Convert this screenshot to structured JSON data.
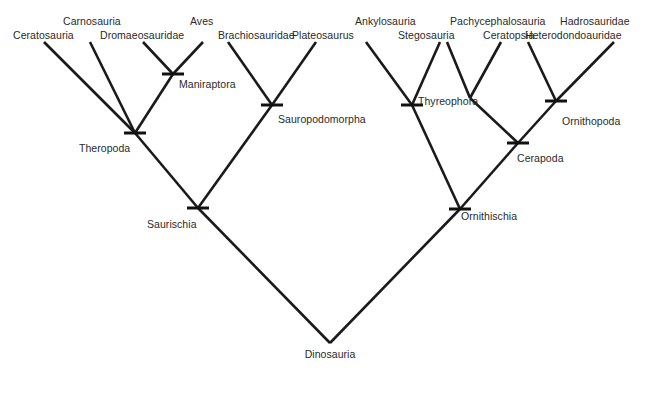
{
  "figure": {
    "type": "cladogram",
    "background_color": "#ffffff",
    "line_color": "#1a1a1a",
    "text_color": "#2a2a2a"
  },
  "tips": [
    {
      "id": "ceratosauria",
      "label": "Ceratosauria",
      "label_x": 13,
      "label_y": 30,
      "anchor": "start"
    },
    {
      "id": "carnosauria",
      "label": "Carnosauria",
      "label_x": 63,
      "label_y": 16,
      "anchor": "start"
    },
    {
      "id": "dromaeosauridae",
      "label": "Dromaeosauridae",
      "label_x": 100,
      "label_y": 30,
      "anchor": "start"
    },
    {
      "id": "aves",
      "label": "Aves",
      "label_x": 190,
      "label_y": 16,
      "anchor": "start"
    },
    {
      "id": "brachiosauridae",
      "label": "Brachiosauridae",
      "label_x": 218,
      "label_y": 30,
      "anchor": "start"
    },
    {
      "id": "plateosaurus",
      "label": "Plateosaurus",
      "label_x": 292,
      "label_y": 30,
      "anchor": "start"
    },
    {
      "id": "ankylosauria",
      "label": "Ankylosauria",
      "label_x": 355,
      "label_y": 16,
      "anchor": "start"
    },
    {
      "id": "stegosauria",
      "label": "Stegosauria",
      "label_x": 398,
      "label_y": 30,
      "anchor": "start"
    },
    {
      "id": "pachycephalosauria",
      "label": "Pachycephalosauria",
      "label_x": 450,
      "label_y": 16,
      "anchor": "start"
    },
    {
      "id": "ceratopsia",
      "label": "Ceratopsia",
      "label_x": 483,
      "label_y": 30,
      "anchor": "start"
    },
    {
      "id": "hadrosauridae",
      "label": "Hadrosauridae",
      "label_x": 560,
      "label_y": 16,
      "anchor": "start"
    },
    {
      "id": "heterodondoauridae",
      "label": "Heterodondoauridae",
      "label_x": 525,
      "label_y": 30,
      "anchor": "start"
    }
  ],
  "nodes": [
    {
      "id": "maniraptora",
      "label": "Maniraptora",
      "x": 173,
      "y": 74,
      "label_x": 179,
      "label_y": 79,
      "tick": true
    },
    {
      "id": "theropoda",
      "label": "Theropoda",
      "x": 135,
      "y": 133,
      "label_x": 79,
      "label_y": 143,
      "tick": true
    },
    {
      "id": "sauropodomorpha",
      "label": "Sauropodomorpha",
      "x": 272,
      "y": 105,
      "label_x": 278,
      "label_y": 114,
      "tick": true
    },
    {
      "id": "saurischia",
      "label": "Saurischia",
      "x": 198,
      "y": 208,
      "label_x": 147,
      "label_y": 219,
      "tick": true
    },
    {
      "id": "thyreophora",
      "label": "Thyreophora",
      "x": 412,
      "y": 105,
      "label_x": 418,
      "label_y": 96,
      "tick": true
    },
    {
      "id": "marginocephalia",
      "label": "",
      "x": 470,
      "y": 98,
      "label_x": 0,
      "label_y": 0,
      "tick": false
    },
    {
      "id": "ornithopoda",
      "label": "Ornithopoda",
      "x": 556,
      "y": 101,
      "label_x": 562,
      "label_y": 116,
      "tick": true
    },
    {
      "id": "cerapoda",
      "label": "Cerapoda",
      "x": 518,
      "y": 143,
      "label_x": 517,
      "label_y": 153,
      "tick": true
    },
    {
      "id": "ornithischia",
      "label": "Ornithischia",
      "x": 460,
      "y": 209,
      "label_x": 461,
      "label_y": 211,
      "tick": true
    },
    {
      "id": "dinosauria",
      "label": "Dinosauria",
      "x": 330,
      "y": 343,
      "label_x": 330,
      "label_y": 349,
      "tick": false
    }
  ],
  "branches": [
    {
      "from": "theropoda",
      "to": "ceratosauria",
      "x1": 135,
      "y1": 133,
      "x2": 44,
      "y2": 42
    },
    {
      "from": "theropoda",
      "to": "carnosauria",
      "x1": 135,
      "y1": 133,
      "x2": 90,
      "y2": 42
    },
    {
      "from": "theropoda",
      "to": "maniraptora",
      "x1": 135,
      "y1": 133,
      "x2": 173,
      "y2": 74
    },
    {
      "from": "maniraptora",
      "to": "dromaeosauridae",
      "x1": 173,
      "y1": 74,
      "x2": 143,
      "y2": 42
    },
    {
      "from": "maniraptora",
      "to": "aves",
      "x1": 173,
      "y1": 74,
      "x2": 203,
      "y2": 42
    },
    {
      "from": "sauropodomorpha",
      "to": "brachiosauridae",
      "x1": 272,
      "y1": 105,
      "x2": 228,
      "y2": 42
    },
    {
      "from": "sauropodomorpha",
      "to": "plateosaurus",
      "x1": 272,
      "y1": 105,
      "x2": 316,
      "y2": 42
    },
    {
      "from": "saurischia",
      "to": "theropoda",
      "x1": 198,
      "y1": 208,
      "x2": 135,
      "y2": 133
    },
    {
      "from": "saurischia",
      "to": "sauropodomorpha",
      "x1": 198,
      "y1": 208,
      "x2": 272,
      "y2": 105
    },
    {
      "from": "thyreophora",
      "to": "ankylosauria",
      "x1": 412,
      "y1": 105,
      "x2": 366,
      "y2": 42
    },
    {
      "from": "thyreophora",
      "to": "stegosauria",
      "x1": 412,
      "y1": 105,
      "x2": 440,
      "y2": 42
    },
    {
      "from": "marginocephalia",
      "to": "pachycephalosauria",
      "x1": 470,
      "y1": 98,
      "x2": 447,
      "y2": 42
    },
    {
      "from": "marginocephalia",
      "to": "ceratopsia",
      "x1": 470,
      "y1": 98,
      "x2": 501,
      "y2": 42
    },
    {
      "from": "cerapoda",
      "to": "marginocephalia",
      "x1": 518,
      "y1": 143,
      "x2": 470,
      "y2": 98
    },
    {
      "from": "cerapoda",
      "to": "ornithopoda",
      "x1": 518,
      "y1": 143,
      "x2": 556,
      "y2": 101
    },
    {
      "from": "ornithopoda",
      "to": "heterodondoauridae",
      "x1": 556,
      "y1": 101,
      "x2": 528,
      "y2": 42
    },
    {
      "from": "ornithopoda",
      "to": "hadrosauridae",
      "x1": 556,
      "y1": 101,
      "x2": 614,
      "y2": 42
    },
    {
      "from": "ornithischia",
      "to": "thyreophora",
      "x1": 460,
      "y1": 209,
      "x2": 412,
      "y2": 105
    },
    {
      "from": "ornithischia",
      "to": "cerapoda",
      "x1": 460,
      "y1": 209,
      "x2": 518,
      "y2": 143
    },
    {
      "from": "dinosauria",
      "to": "saurischia",
      "x1": 330,
      "y1": 343,
      "x2": 198,
      "y2": 208
    },
    {
      "from": "dinosauria",
      "to": "ornithischia",
      "x1": 330,
      "y1": 343,
      "x2": 460,
      "y2": 209
    }
  ],
  "tick_half_width": 11
}
